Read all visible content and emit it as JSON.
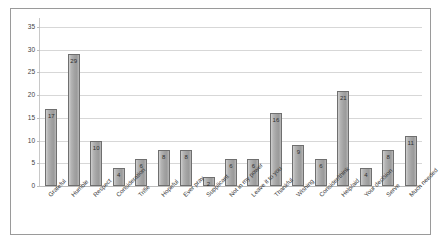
{
  "chart_data": {
    "type": "bar",
    "title": "",
    "subtitle": "",
    "xlabel": "",
    "ylabel": "",
    "ylim": [
      0,
      37
    ],
    "yticks": [
      0,
      5,
      10,
      15,
      20,
      25,
      30,
      35
    ],
    "grid": true,
    "legend": "none",
    "value_labels": true,
    "categories": [
      "Grateful",
      "Humble",
      "Respect",
      "Consideration",
      "Trifle",
      "Hopeful",
      "Ever pray",
      "Supplicant",
      "Not in my power",
      "Leave it to you",
      "Thankful",
      "Wishing",
      "Consider/think",
      "Help/aid",
      "Your decision",
      "Serve",
      "Much needed"
    ],
    "values": [
      17,
      29,
      10,
      4,
      6,
      8,
      8,
      2,
      6,
      6,
      16,
      9,
      6,
      21,
      4,
      8,
      11
    ],
    "colors": {
      "bar_fill": "#a8a8a8",
      "bar_border": "#6f6f6f",
      "gridline": "#d7d7d7",
      "frame": "#9a9a9a",
      "background": "#ffffff",
      "text": "#3a3a3a"
    }
  }
}
